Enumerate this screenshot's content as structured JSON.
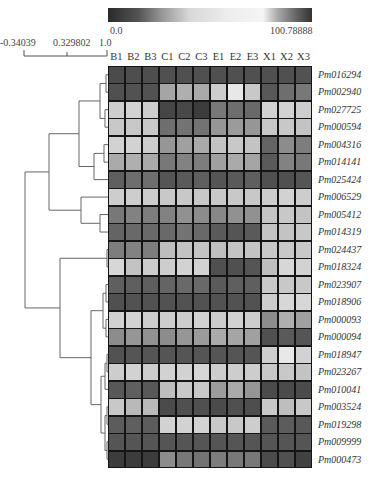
{
  "chart_data": {
    "type": "heatmap",
    "title": "",
    "colorbar": {
      "min_label": "0.0",
      "max_label": "100.78888",
      "min": 0.0,
      "max": 100.78888
    },
    "dendrogram_scale": {
      "labels": [
        "-0.34039",
        "0.329802",
        "1.0"
      ]
    },
    "columns": [
      "B1",
      "B2",
      "B3",
      "C1",
      "C2",
      "C3",
      "E1",
      "E2",
      "E3",
      "X1",
      "X2",
      "X3"
    ],
    "rows": [
      "Pm016294",
      "Pm002940",
      "Pm027725",
      "Pm000594",
      "Pm004316",
      "Pm014141",
      "Pm025424",
      "Pm006529",
      "Pm005412",
      "Pm014319",
      "Pm024437",
      "Pm018324",
      "Pm023907",
      "Pm018906",
      "Pm000093",
      "Pm000094",
      "Pm018947",
      "Pm023267",
      "Pm010041",
      "Pm003524",
      "Pm019298",
      "Pm009999",
      "Pm000473"
    ],
    "gray_levels": [
      [
        75,
        78,
        78,
        80,
        80,
        80,
        80,
        80,
        80,
        80,
        80,
        82
      ],
      [
        80,
        82,
        82,
        165,
        175,
        170,
        205,
        232,
        200,
        88,
        110,
        120
      ],
      [
        205,
        210,
        205,
        70,
        72,
        60,
        120,
        110,
        105,
        210,
        210,
        205
      ],
      [
        200,
        200,
        200,
        110,
        115,
        115,
        150,
        155,
        150,
        200,
        200,
        195
      ],
      [
        210,
        210,
        205,
        150,
        160,
        170,
        195,
        200,
        195,
        100,
        140,
        125
      ],
      [
        170,
        175,
        170,
        120,
        130,
        125,
        160,
        170,
        165,
        90,
        130,
        120
      ],
      [
        95,
        110,
        110,
        85,
        90,
        95,
        85,
        90,
        95,
        80,
        80,
        85
      ],
      [
        205,
        205,
        205,
        200,
        200,
        200,
        200,
        200,
        200,
        205,
        210,
        205
      ],
      [
        120,
        130,
        125,
        130,
        145,
        140,
        135,
        145,
        145,
        195,
        200,
        195
      ],
      [
        100,
        105,
        105,
        105,
        115,
        105,
        90,
        85,
        90,
        195,
        195,
        200
      ],
      [
        125,
        130,
        125,
        190,
        195,
        195,
        190,
        195,
        195,
        200,
        200,
        200
      ],
      [
        215,
        195,
        205,
        205,
        210,
        210,
        80,
        80,
        85,
        190,
        215,
        210
      ],
      [
        95,
        95,
        95,
        100,
        105,
        105,
        90,
        95,
        95,
        200,
        200,
        200
      ],
      [
        80,
        82,
        82,
        82,
        82,
        82,
        82,
        82,
        82,
        205,
        215,
        215
      ],
      [
        210,
        210,
        205,
        205,
        205,
        210,
        205,
        210,
        205,
        140,
        175,
        160
      ],
      [
        140,
        150,
        145,
        140,
        150,
        155,
        170,
        165,
        160,
        80,
        90,
        85
      ],
      [
        82,
        85,
        85,
        85,
        85,
        85,
        85,
        85,
        85,
        205,
        232,
        210
      ],
      [
        205,
        210,
        205,
        210,
        210,
        215,
        205,
        205,
        205,
        200,
        200,
        195
      ],
      [
        88,
        95,
        88,
        190,
        200,
        200,
        155,
        170,
        150,
        75,
        75,
        75
      ],
      [
        200,
        185,
        185,
        75,
        80,
        80,
        75,
        80,
        78,
        200,
        190,
        200
      ],
      [
        92,
        95,
        92,
        210,
        210,
        210,
        200,
        200,
        205,
        90,
        92,
        88
      ],
      [
        85,
        85,
        85,
        85,
        85,
        85,
        85,
        85,
        85,
        85,
        85,
        85
      ],
      [
        60,
        60,
        60,
        140,
        120,
        115,
        125,
        120,
        120,
        75,
        80,
        65
      ]
    ],
    "legend_position": "top",
    "grid": true
  },
  "labels": {
    "colorbar_min": "0.0",
    "colorbar_max": "100.78888",
    "scale_left": "-0.34039",
    "scale_mid": "0.329802",
    "scale_right": "1.0"
  }
}
